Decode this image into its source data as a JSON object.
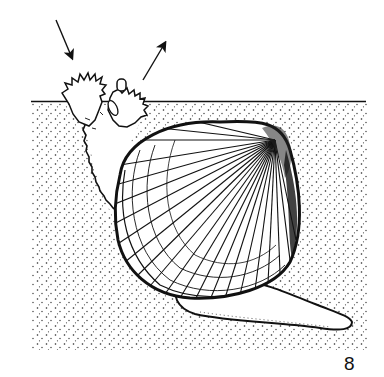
{
  "figure": {
    "number": "8",
    "arrows": [
      {
        "name": "inhalant-current-arrow",
        "direction": "down-right (into inhalant siphon)"
      },
      {
        "name": "exhalant-current-arrow",
        "direction": "up-right (out of exhalant siphon)"
      }
    ],
    "colors": {
      "ink": "#111111",
      "background": "#ffffff"
    }
  }
}
